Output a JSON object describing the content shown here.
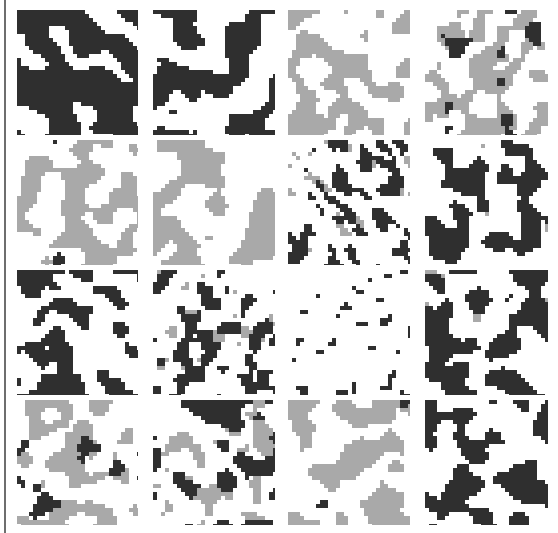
{
  "figure": {
    "colors": {
      "background": "#ffffff",
      "dark": "#2f2f2f",
      "gray": "#a9a9a9",
      "rule": "#6e6e6e"
    },
    "columns_x": [
      17,
      153,
      288,
      425
    ],
    "column_widths": [
      121,
      122,
      122,
      123
    ],
    "rows_y": [
      10,
      140,
      270,
      400
    ],
    "row_heights": [
      125,
      125,
      125,
      125
    ],
    "cell_size": 4,
    "tiles": [
      {
        "row": 0,
        "col": 0,
        "style": "dark-diagonal-slabs",
        "dark": 0.72,
        "gray": 0.0,
        "seed": 11,
        "blob": 9
      },
      {
        "row": 0,
        "col": 1,
        "style": "dark-blobs",
        "dark": 0.45,
        "gray": 0.0,
        "seed": 23,
        "blob": 4
      },
      {
        "row": 0,
        "col": 2,
        "style": "gray-blobs",
        "dark": 0.0,
        "gray": 0.45,
        "seed": 37,
        "blob": 4
      },
      {
        "row": 0,
        "col": 3,
        "style": "gray-with-dark-specks",
        "dark": 0.08,
        "gray": 0.45,
        "seed": 41,
        "blob": 3
      },
      {
        "row": 1,
        "col": 0,
        "style": "gray-blobs-sparse-dark",
        "dark": 0.01,
        "gray": 0.45,
        "seed": 53,
        "blob": 4
      },
      {
        "row": 1,
        "col": 1,
        "style": "gray-blobs",
        "dark": 0.0,
        "gray": 0.45,
        "seed": 67,
        "blob": 4
      },
      {
        "row": 1,
        "col": 2,
        "style": "dark-outlined-diagonal",
        "dark": 0.28,
        "gray": 0.08,
        "seed": 71,
        "blob": 2
      },
      {
        "row": 1,
        "col": 3,
        "style": "dark-blobs",
        "dark": 0.42,
        "gray": 0.02,
        "seed": 83,
        "blob": 4
      },
      {
        "row": 2,
        "col": 0,
        "style": "dark-branching",
        "dark": 0.4,
        "gray": 0.0,
        "seed": 97,
        "blob": 3
      },
      {
        "row": 2,
        "col": 1,
        "style": "dark-fragmented",
        "dark": 0.3,
        "gray": 0.06,
        "seed": 101,
        "blob": 2
      },
      {
        "row": 2,
        "col": 2,
        "style": "dark-thin-chain",
        "dark": 0.07,
        "gray": 0.0,
        "seed": 113,
        "blob": 1
      },
      {
        "row": 2,
        "col": 3,
        "style": "dark-blobs",
        "dark": 0.48,
        "gray": 0.04,
        "seed": 127,
        "blob": 4
      },
      {
        "row": 3,
        "col": 0,
        "style": "gray-with-dark-specks",
        "dark": 0.08,
        "gray": 0.38,
        "seed": 131,
        "blob": 3
      },
      {
        "row": 3,
        "col": 1,
        "style": "mixed-dark-gray",
        "dark": 0.25,
        "gray": 0.25,
        "seed": 149,
        "blob": 3
      },
      {
        "row": 3,
        "col": 2,
        "style": "gray-blobs",
        "dark": 0.01,
        "gray": 0.45,
        "seed": 157,
        "blob": 4
      },
      {
        "row": 3,
        "col": 3,
        "style": "dark-blobs",
        "dark": 0.42,
        "gray": 0.0,
        "seed": 163,
        "blob": 4
      }
    ]
  }
}
